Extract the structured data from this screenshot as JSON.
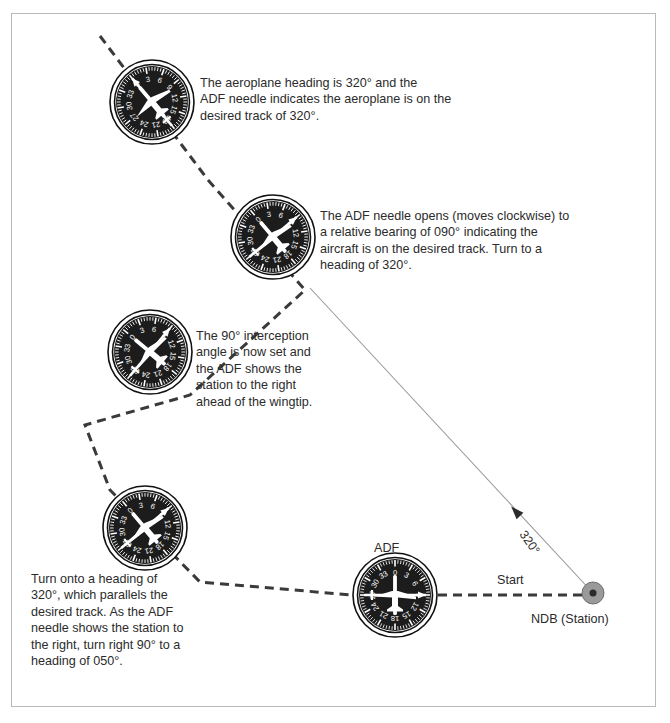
{
  "figure": {
    "kind": "adf-ndb-interception-diagram",
    "frame_border_color": "#b9b9bb",
    "background": "#ffffff",
    "track_color": "#3a3a3a",
    "instrument_body_color": "#1c1c1c",
    "instrument_ring_color": "#ffffff",
    "instrument_outline_color": "#111111",
    "needle_color": "#ffffff",
    "ndb_fill_color": "#9a9a9a",
    "ndb_dot_color": "#2b2b2b",
    "bearing_line_color": "#9a9a9a"
  },
  "callouts": [
    {
      "id": "callout-1",
      "text": "The aeroplane heading is 320° and the\nADF needle indicates the aeroplane is on the\ndesired track of 320°."
    },
    {
      "id": "callout-2",
      "text": "The ADF needle opens (moves clockwise) to\na relative bearing of 090° indicating the\naircraft is on the desired track. Turn to a\nheading of 320°."
    },
    {
      "id": "callout-3",
      "text": "The 90° interception\nangle is now set and\nthe ADF shows the\nstation to the right\nahead of the wingtip."
    },
    {
      "id": "callout-4",
      "text": "Turn onto a heading of\n320°, which parallels the\ndesired track. As the ADF\nneedle shows the station to\nthe right, turn right 90° to a\nheading of 050°."
    }
  ],
  "map_labels": {
    "adf": "ADF",
    "start": "Start",
    "ndb": "NDB (Station)",
    "bearing_320": "320°"
  },
  "instruments": [
    {
      "id": "instrument-1",
      "name": "adf-instrument-top",
      "cx": 152,
      "cy": 102,
      "r": 42,
      "card_rotation": -40,
      "aircraft_rotation": -40,
      "needle_rotation": -40,
      "heading": "320",
      "relative_bearing": "000"
    },
    {
      "id": "instrument-2",
      "name": "adf-instrument-second",
      "cx": 273,
      "cy": 237,
      "r": 42,
      "card_rotation": -40,
      "aircraft_rotation": -40,
      "needle_rotation": 50,
      "heading": "320",
      "relative_bearing": "090"
    },
    {
      "id": "instrument-3",
      "name": "adf-instrument-third",
      "cx": 150,
      "cy": 352,
      "r": 42,
      "card_rotation": -50,
      "aircraft_rotation": -50,
      "needle_rotation": 40,
      "heading": "050",
      "relative_bearing": "090"
    },
    {
      "id": "instrument-4",
      "name": "adf-instrument-fourth",
      "cx": 145,
      "cy": 528,
      "r": 42,
      "card_rotation": -40,
      "aircraft_rotation": -40,
      "needle_rotation": 50,
      "heading": "320",
      "relative_bearing": "090"
    },
    {
      "id": "instrument-5",
      "name": "adf-instrument-start",
      "cx": 395,
      "cy": 595,
      "r": 42,
      "card_rotation": 0,
      "aircraft_rotation": 0,
      "needle_rotation": 90,
      "heading": "360",
      "relative_bearing": "090"
    }
  ],
  "compass_ticks": {
    "labels": [
      "0",
      "3",
      "6",
      "9",
      "12",
      "15",
      "18",
      "21",
      "24",
      "27",
      "30",
      "33"
    ]
  },
  "track": {
    "name": "desired-track-path",
    "segments": [
      {
        "from": [
          100,
          36
        ],
        "to": [
          208,
          180
        ]
      },
      {
        "from": [
          208,
          180
        ],
        "to": [
          305,
          290
        ]
      },
      {
        "from": [
          305,
          290
        ],
        "to": [
          190,
          395
        ]
      },
      {
        "from": [
          190,
          395
        ],
        "to": [
          85,
          425
        ]
      },
      {
        "from": [
          85,
          425
        ],
        "to": [
          110,
          490
        ]
      },
      {
        "from": [
          110,
          490
        ],
        "to": [
          200,
          582
        ]
      },
      {
        "from": [
          200,
          582
        ],
        "to": [
          352,
          595
        ]
      }
    ],
    "dash": "9 6"
  },
  "bearing_line": {
    "name": "ndb-bearing-line",
    "from": [
      593,
      593
    ],
    "to": [
      310,
      288
    ],
    "arrow_at": [
      520,
      516
    ]
  },
  "ndb_station": {
    "cx": 593,
    "cy": 593,
    "outer_r": 11,
    "inner_r": 3.5
  },
  "start_leg": {
    "from": [
      438,
      595
    ],
    "to": [
      582,
      595
    ]
  }
}
